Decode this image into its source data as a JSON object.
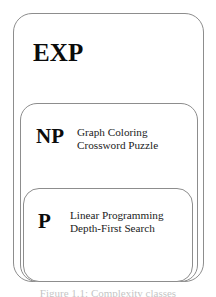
{
  "figure": {
    "background_color": "#ffffff",
    "border_color": "#8d8d8d",
    "text_color": "#0b0b0b",
    "caption": "Figure 1.1: Complexity classes",
    "classes": [
      {
        "id": "exp",
        "label": "EXP",
        "examples": []
      },
      {
        "id": "np",
        "label": "NP",
        "examples": [
          "Graph Coloring",
          "Crossword Puzzle"
        ]
      },
      {
        "id": "p",
        "label": "P",
        "examples": [
          "Linear Programming",
          "Depth-First Search"
        ]
      }
    ]
  }
}
